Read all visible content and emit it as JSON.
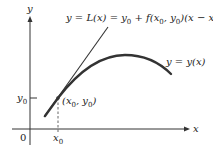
{
  "diagram": {
    "axes": {
      "x_label": "x",
      "y_label": "y",
      "origin_label": "0"
    },
    "ticks": {
      "x0_label": "x",
      "x0_sub": "0",
      "y0_label": "y",
      "y0_sub": "0"
    },
    "point_label": {
      "open": "(x",
      "sub1": "0",
      "mid": ", y",
      "sub2": "0",
      "close": ")"
    },
    "tangent_label": {
      "text_a": "y = L(x) = y",
      "sub_a": "0",
      "text_b": " + f(x",
      "sub_b": "0",
      "text_c": ", y",
      "sub_c": "0",
      "text_d": ")(x − x",
      "sub_d": "0",
      "text_e": ")"
    },
    "curve_label": "y = y(x)",
    "colors": {
      "axis": "#333333",
      "curve": "#333333",
      "tangent": "#333333",
      "dashed": "#555555"
    }
  }
}
